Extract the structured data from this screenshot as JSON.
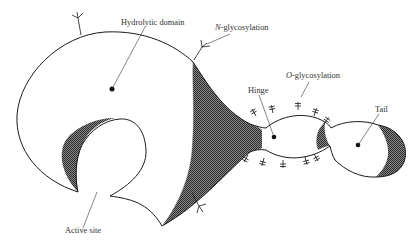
{
  "diagram": {
    "labels": {
      "hydrolytic_domain": "Hydrolytic domain",
      "n_glyco_prefix": "N",
      "n_glyco_suffix": "-glycosylation",
      "o_glyco_prefix": "O",
      "o_glyco_suffix": "-glycosylation",
      "hinge": "Hinge",
      "tail": "Tail",
      "active_site": "Active site"
    },
    "colors": {
      "stroke": "#1a1a1a",
      "shade": "#555555",
      "background": "#ffffff",
      "text": "#333333"
    }
  }
}
